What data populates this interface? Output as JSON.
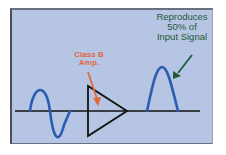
{
  "diagram": {
    "amp_label_line1": "Class B",
    "amp_label_line2": "Amp.",
    "output_label_line1": "Reproduces",
    "output_label_line2": "50% of",
    "output_label_line3": "Input Signal",
    "components": {
      "input_signal": "full sine wave",
      "amplifier": "triangle amplifier symbol",
      "output_signal": "positive half-wave"
    },
    "colors": {
      "background": "#b6c5e3",
      "border": "#4a4f5c",
      "wave": "#2a5cb0",
      "baseline": "#111111",
      "amp_label": "#e06a3a",
      "output_label": "#1f5a3a"
    }
  }
}
